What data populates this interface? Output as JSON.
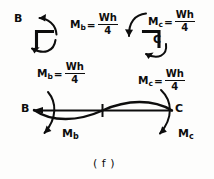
{
  "figure": {
    "caption": "( f )",
    "type": "structural-engineering-hand-drawing"
  },
  "joints": {
    "left": {
      "node_label": "B",
      "equation": {
        "symbol": "M",
        "subscript": "b",
        "equals": "=",
        "numerator": "Wh",
        "denominator": "4"
      },
      "rotation": "counterclockwise"
    },
    "right": {
      "node_label": "C",
      "equation": {
        "symbol": "M",
        "subscript": "c",
        "equals": "=",
        "numerator": "Wh",
        "denominator": "4"
      },
      "rotation": "clockwise"
    }
  },
  "mid_equations": {
    "left": {
      "symbol": "M",
      "subscript": "b",
      "equals": "=",
      "numerator": "Wh",
      "denominator": "4"
    },
    "right": {
      "symbol": "M",
      "subscript": "c",
      "equals": "=",
      "numerator": "Wh",
      "denominator": "4"
    }
  },
  "beam": {
    "left_node_label": "B",
    "right_node_label": "C",
    "left_moment": {
      "symbol": "M",
      "subscript": "b"
    },
    "right_moment": {
      "symbol": "M",
      "subscript": "c"
    },
    "shape": "double-curvature S-curve with central inflection point"
  }
}
